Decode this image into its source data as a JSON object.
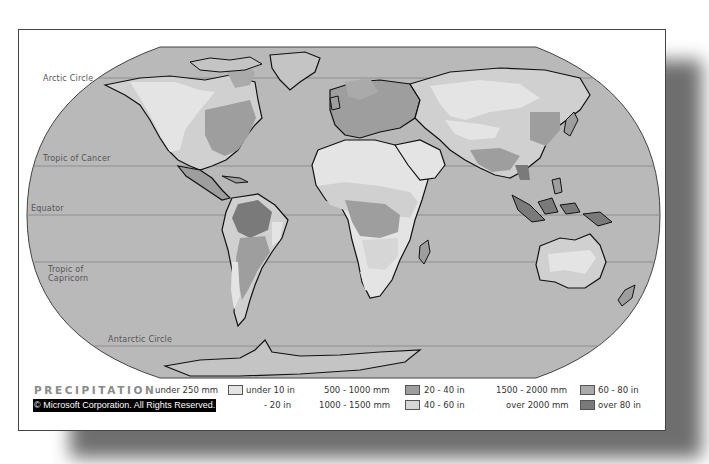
{
  "map": {
    "title": "PRECIPITATION",
    "copyright": "© Microsoft Corporation. All Rights Reserved.",
    "latitude_lines": [
      {
        "name": "arctic-circle",
        "label": "Arctic Circle"
      },
      {
        "name": "tropic-of-cancer",
        "label": "Tropic of Cancer"
      },
      {
        "name": "equator",
        "label": "Equator"
      },
      {
        "name": "tropic-of-capricorn",
        "label_line1": "Tropic of",
        "label_line2": "Capricorn"
      },
      {
        "name": "antarctic-circle",
        "label": "Antarctic Circle"
      }
    ],
    "colors": {
      "ocean": "#b9b9b9",
      "under_250mm": "#e4e4e4",
      "250_500mm": "#d0d0d0",
      "500_1000mm": "#9e9e9e",
      "1000_1500mm": "#d6d6d6",
      "1500_2000mm": "#aaaaaa",
      "over_2000mm": "#7a7a7a",
      "coastline": "#111111"
    }
  },
  "legend": {
    "items": [
      {
        "mm": "under 250 mm",
        "in": "under 10 in",
        "color": "#e4e4e4"
      },
      {
        "mm": "250 - 500 mm",
        "in": "10 - 20 in",
        "color": "#d0d0d0",
        "mm_hidden_by_copyright": true,
        "visible_in": "- 20 in"
      },
      {
        "mm": "500 - 1000 mm",
        "in": "20 - 40 in",
        "color": "#9e9e9e"
      },
      {
        "mm": "1000 - 1500 mm",
        "in": "40 - 60 in",
        "color": "#d6d6d6"
      },
      {
        "mm": "1500 - 2000 mm",
        "in": "60 - 80 in",
        "color": "#aaaaaa"
      },
      {
        "mm": "over 2000 mm",
        "in": "over 80 in",
        "color": "#7a7a7a"
      }
    ]
  }
}
